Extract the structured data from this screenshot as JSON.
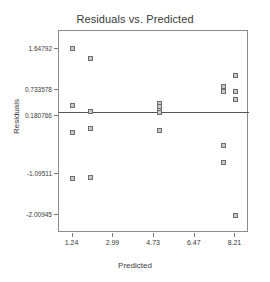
{
  "chart_data": {
    "type": "scatter",
    "title": "Residuals vs. Predicted",
    "xlabel": "Predicted",
    "ylabel": "Residuals",
    "grid": false,
    "legend": null,
    "xlim": [
      0.66,
      8.79
    ],
    "ylim": [
      -2.4,
      2.04
    ],
    "xticks": [
      1.24,
      2.99,
      4.73,
      6.47,
      8.21
    ],
    "xtick_labels": [
      "1.24",
      "2.99",
      "4.73",
      "6.47",
      "8.21"
    ],
    "yticks": [
      1.64792,
      0.733578,
      0.180766,
      -1.09511,
      -2.00945
    ],
    "ytick_labels": [
      "1.64792",
      "0.733578",
      "0.180766",
      "-1.09511",
      "-2.00945"
    ],
    "reference_line": {
      "orientation": "horizontal",
      "y": 0.2615
    },
    "marker": "square",
    "marker_color": "#c9c9c9",
    "marker_edge_color": "#6e6e6e",
    "points": [
      {
        "x": 1.24,
        "y": 1.64792
      },
      {
        "x": 1.24,
        "y": 0.3946
      },
      {
        "x": 1.24,
        "y": -0.1803
      },
      {
        "x": 1.24,
        "y": -1.1931
      },
      {
        "x": 1.99,
        "y": 1.4272
      },
      {
        "x": 1.99,
        "y": 0.2615
      },
      {
        "x": 1.99,
        "y": -0.0922
      },
      {
        "x": 1.99,
        "y": -1.171
      },
      {
        "x": 4.98,
        "y": 0.45
      },
      {
        "x": 4.98,
        "y": 0.3705
      },
      {
        "x": 4.98,
        "y": 0.2911
      },
      {
        "x": 4.98,
        "y": 0.238
      },
      {
        "x": 4.98,
        "y": -0.1361
      },
      {
        "x": 7.72,
        "y": 0.823
      },
      {
        "x": 7.72,
        "y": 0.711
      },
      {
        "x": 7.72,
        "y": -0.468
      },
      {
        "x": 7.72,
        "y": -0.842
      },
      {
        "x": 8.21,
        "y": 1.06
      },
      {
        "x": 8.21,
        "y": 0.711
      },
      {
        "x": 8.21,
        "y": 0.542
      },
      {
        "x": 8.21,
        "y": -2.00945
      }
    ]
  }
}
